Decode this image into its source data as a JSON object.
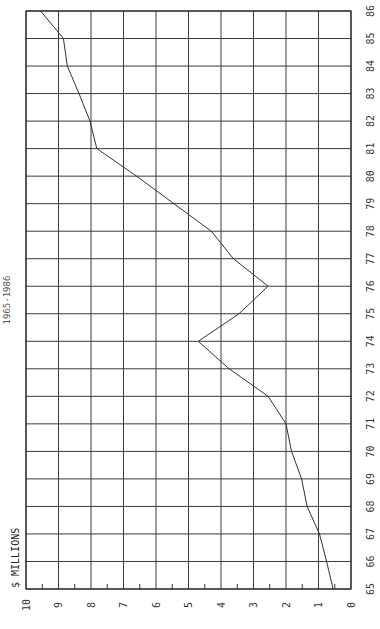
{
  "chart_data": {
    "type": "line",
    "title": "1965-1986",
    "xlabel": "",
    "ylabel": "$ MILLIONS",
    "orientation": "rotated 90° counter-clockwise (value axis runs horizontally along bottom, 10 at left to 0 at right; years run vertically on right, 65 at bottom to 86 at top)",
    "categories": [
      "65",
      "66",
      "67",
      "68",
      "69",
      "70",
      "71",
      "72",
      "73",
      "74",
      "75",
      "76",
      "77",
      "78",
      "79",
      "80",
      "81",
      "82",
      "83",
      "84",
      "85",
      "86"
    ],
    "series": [
      {
        "name": "$ Millions",
        "values": [
          0.55,
          0.75,
          0.97,
          1.35,
          1.52,
          1.83,
          2.0,
          2.55,
          3.75,
          4.7,
          3.45,
          2.55,
          3.62,
          4.3,
          5.45,
          6.6,
          7.82,
          8.03,
          8.37,
          8.73,
          8.85,
          9.55
        ]
      }
    ],
    "ylim": [
      0,
      10
    ],
    "y_ticks": [
      "0",
      "1",
      "2",
      "3",
      "4",
      "5",
      "6",
      "7",
      "8",
      "9",
      "10"
    ],
    "grid": true,
    "minor_ticks": "half-unit tick marks along value axis",
    "legend": "none"
  },
  "labels": {
    "title": "1965-1986",
    "ylabel": "$ MILLIONS"
  }
}
